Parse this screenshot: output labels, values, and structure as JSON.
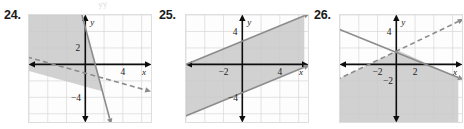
{
  "page": {
    "background": "#ffffff",
    "stray_mark": "yy"
  },
  "style": {
    "grid_color": "#d7d7d7",
    "axis_color": "#0d0d0d",
    "line_color": "#8c8c8c",
    "shade_color": "#c9c9c9",
    "frame_color": "#dedede",
    "label_color": "#1a1a1a"
  },
  "problems": [
    {
      "number": "24.",
      "plot": {
        "x_axis_label": "x",
        "y_axis_label": "y",
        "tick_labels": [
          {
            "text": "2",
            "x": -0.55,
            "y": 2.0,
            "anchor": "end"
          },
          {
            "text": "4",
            "x": 4.0,
            "y": -0.95,
            "anchor": "middle"
          },
          {
            "text": "−4",
            "x": -0.45,
            "y": -4.0,
            "anchor": "end"
          }
        ]
      },
      "chart_data": {
        "type": "line",
        "title": "",
        "xlabel": "x",
        "ylabel": "y",
        "xlim": [
          -6,
          7
        ],
        "ylim": [
          -7,
          6
        ],
        "grid": true,
        "grid_step": 2,
        "ticks_x": [
          -4,
          -2,
          2,
          4,
          6
        ],
        "ticks_y": [
          -6,
          -4,
          -2,
          2,
          4
        ],
        "series": [
          {
            "name": "boundary-solid",
            "style": "solid",
            "points": [
              [
                -0.4,
                6.2
              ],
              [
                2.6,
                -6.6
              ]
            ],
            "arrows": "both"
          },
          {
            "name": "boundary-dashed",
            "style": "dashed",
            "points": [
              [
                -6.2,
                0.9
              ],
              [
                6.4,
                -3.1
              ]
            ],
            "arrows": "both"
          }
        ],
        "shaded_region": {
          "description": "region left of the steep solid line and above the dashed line",
          "fill": "#c9c9c9",
          "polygon": [
            [
              -6,
              6.2
            ],
            [
              -0.4,
              6.2
            ],
            [
              1.9,
              -3.3
            ],
            [
              -6,
              -0.8
            ]
          ]
        }
      }
    },
    {
      "number": "25.",
      "plot": {
        "x_axis_label": "x",
        "y_axis_label": "y",
        "tick_labels": [
          {
            "text": "4",
            "x": -0.5,
            "y": 4.0,
            "anchor": "end"
          },
          {
            "text": "−2",
            "x": -2.0,
            "y": -0.95,
            "anchor": "middle"
          },
          {
            "text": "4",
            "x": 4.0,
            "y": -0.95,
            "anchor": "middle"
          },
          {
            "text": "−4",
            "x": -0.45,
            "y": -4.0,
            "anchor": "end"
          }
        ]
      },
      "chart_data": {
        "type": "line",
        "title": "",
        "xlabel": "x",
        "ylabel": "y",
        "xlim": [
          -6,
          7
        ],
        "ylim": [
          -7,
          6
        ],
        "grid": true,
        "grid_step": 2,
        "ticks_x": [
          -4,
          -2,
          2,
          4,
          6
        ],
        "ticks_y": [
          -6,
          -4,
          -2,
          2,
          4
        ],
        "series": [
          {
            "name": "boundary-upper-solid",
            "style": "solid",
            "points": [
              [
                -6.3,
                -0.15
              ],
              [
                6.6,
                5.9
              ]
            ],
            "arrows": "both"
          },
          {
            "name": "boundary-lower-solid",
            "style": "solid",
            "points": [
              [
                -6.3,
                -6.4
              ],
              [
                6.6,
                -0.35
              ]
            ],
            "arrows": "both"
          }
        ],
        "shaded_region": {
          "description": "band between two parallel solid lines",
          "fill": "#c9c9c9",
          "polygon": [
            [
              -6.3,
              -0.15
            ],
            [
              6.6,
              5.9
            ],
            [
              6.6,
              -0.35
            ],
            [
              -6.3,
              -6.4
            ]
          ]
        }
      }
    },
    {
      "number": "26.",
      "plot": {
        "x_axis_label": "x",
        "y_axis_label": "y",
        "tick_labels": [
          {
            "text": "4",
            "x": -0.5,
            "y": 4.0,
            "anchor": "end"
          },
          {
            "text": "−2",
            "x": -2.0,
            "y": -0.95,
            "anchor": "middle"
          },
          {
            "text": "2",
            "x": 2.0,
            "y": -0.95,
            "anchor": "middle"
          },
          {
            "text": "−2",
            "x": -0.35,
            "y": -2.0,
            "anchor": "end"
          }
        ]
      },
      "chart_data": {
        "type": "line",
        "title": "",
        "xlabel": "x",
        "ylabel": "y",
        "xlim": [
          -6,
          7
        ],
        "ylim": [
          -7,
          6
        ],
        "grid": true,
        "grid_step": 2,
        "ticks_x": [
          -4,
          -2,
          2,
          4,
          6
        ],
        "ticks_y": [
          -6,
          -4,
          -2,
          2,
          4
        ],
        "series": [
          {
            "name": "boundary-solid-descending",
            "style": "solid",
            "points": [
              [
                -6.4,
                4.4
              ],
              [
                6.6,
                -1.6
              ]
            ],
            "arrows": "both"
          },
          {
            "name": "boundary-dashed-ascending",
            "style": "dashed",
            "points": [
              [
                -6.4,
                -1.9
              ],
              [
                6.6,
                5.2
              ]
            ],
            "arrows": "both"
          }
        ],
        "shaded_region": {
          "description": "region below the solid line and below the dashed line",
          "fill": "#c9c9c9",
          "polygon": [
            [
              -6.4,
              -1.9
            ],
            [
              0.2,
              1.7
            ],
            [
              6.6,
              -1.6
            ],
            [
              6.6,
              -7
            ],
            [
              -6.4,
              -7
            ]
          ]
        }
      }
    }
  ]
}
